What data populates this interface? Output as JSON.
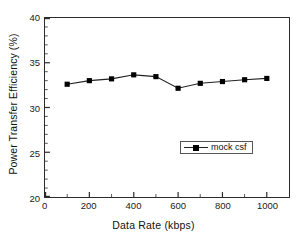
{
  "chart_data": {
    "type": "line",
    "title": "",
    "xlabel": "Data Rate (kbps)",
    "ylabel": "Power Transfer Efficiency (%)",
    "xlim": [
      0,
      1100
    ],
    "ylim": [
      20,
      40
    ],
    "xticks": [
      0,
      200,
      400,
      600,
      800,
      1000
    ],
    "xtick_labels": [
      "0",
      "200",
      "400",
      "600",
      "800",
      "1000"
    ],
    "x_minor_tick_interval": 100,
    "yticks": [
      20,
      25,
      30,
      35,
      40
    ],
    "ytick_labels": [
      "20",
      "25",
      "30",
      "35",
      "40"
    ],
    "y_minor_tick_interval": 1,
    "grid": false,
    "legend_position": "lower right",
    "marker": "square",
    "marker_color": "#000000",
    "line_color": "#222222",
    "series": [
      {
        "name": "mock csf",
        "x": [
          100,
          200,
          300,
          400,
          500,
          600,
          700,
          800,
          900,
          1000
        ],
        "values": [
          32.6,
          33.0,
          33.2,
          33.65,
          33.45,
          32.15,
          32.7,
          32.9,
          33.1,
          33.25
        ]
      }
    ]
  },
  "legend": {
    "entries": [
      {
        "label": "mock csf"
      }
    ]
  },
  "axes": {
    "x_title": "Data Rate (kbps)",
    "y_title": "Power Transfer Efficiency (%)"
  }
}
